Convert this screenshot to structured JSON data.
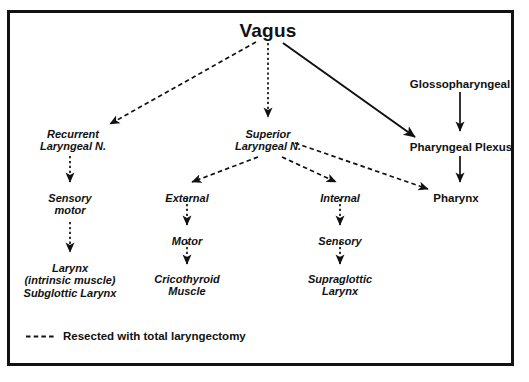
{
  "figure": {
    "title": "Vagus",
    "background_color": "#ffffff",
    "ink_color": "#111111",
    "frame_color": "#121212"
  },
  "nodes": {
    "vagus": {
      "lines": [
        "Vagus"
      ],
      "x": 268,
      "y": 20,
      "style": "title"
    },
    "glossopharyngeal": {
      "lines": [
        "Glossopharyngeal"
      ],
      "x": 460,
      "y": 78,
      "style": "plain"
    },
    "recurrent": {
      "lines": [
        "Recurrent",
        "Laryngeal N."
      ],
      "x": 73,
      "y": 128,
      "style": "branch"
    },
    "superior": {
      "lines": [
        "Superior",
        "Laryngeal N."
      ],
      "x": 268,
      "y": 128,
      "style": "branch"
    },
    "pharyngeal_plexus": {
      "lines": [
        "Pharyngeal Plexus"
      ],
      "x": 461,
      "y": 141,
      "style": "plain"
    },
    "sensory_motor": {
      "lines": [
        "Sensory",
        "motor"
      ],
      "x": 70,
      "y": 192,
      "style": "branch"
    },
    "external": {
      "lines": [
        "External"
      ],
      "x": 187,
      "y": 192,
      "style": "branch"
    },
    "internal": {
      "lines": [
        "Internal"
      ],
      "x": 340,
      "y": 192,
      "style": "branch"
    },
    "pharynx": {
      "lines": [
        "Pharynx"
      ],
      "x": 456,
      "y": 192,
      "style": "plain"
    },
    "motor": {
      "lines": [
        "Motor"
      ],
      "x": 187,
      "y": 235,
      "style": "branch"
    },
    "sensory": {
      "lines": [
        "Sensory"
      ],
      "x": 340,
      "y": 235,
      "style": "branch"
    },
    "larynx_group": {
      "lines": [
        "Larynx",
        "(intrinsic muscle)",
        "Subglottic Larynx"
      ],
      "x": 70,
      "y": 262,
      "style": "branch"
    },
    "cricothyroid": {
      "lines": [
        "Cricothyroid",
        "Muscle"
      ],
      "x": 187,
      "y": 273,
      "style": "branch"
    },
    "supraglottic": {
      "lines": [
        "Supraglottic",
        "Larynx"
      ],
      "x": 340,
      "y": 273,
      "style": "branch"
    }
  },
  "edges": [
    {
      "name": "vagus-to-recurrent",
      "from": "vagus",
      "to": "recurrent",
      "line": "dashed"
    },
    {
      "name": "vagus-to-superior",
      "from": "vagus",
      "to": "superior",
      "line": "dashed"
    },
    {
      "name": "vagus-to-pharyngeal-plexus",
      "from": "vagus",
      "to": "pharyngeal_plexus",
      "line": "solid"
    },
    {
      "name": "glossopharyngeal-to-plexus",
      "from": "glossopharyngeal",
      "to": "pharyngeal_plexus",
      "line": "solid"
    },
    {
      "name": "plexus-to-pharynx",
      "from": "pharyngeal_plexus",
      "to": "pharynx",
      "line": "solid"
    },
    {
      "name": "recurrent-to-sensory-motor",
      "from": "recurrent",
      "to": "sensory_motor",
      "line": "dashed"
    },
    {
      "name": "sensory-motor-to-larynx",
      "from": "sensory_motor",
      "to": "larynx_group",
      "line": "dashed"
    },
    {
      "name": "superior-to-external",
      "from": "superior",
      "to": "external",
      "line": "dashed"
    },
    {
      "name": "superior-to-internal",
      "from": "superior",
      "to": "internal",
      "line": "dashed"
    },
    {
      "name": "superior-to-pharynx",
      "from": "superior",
      "to": "pharynx",
      "line": "dashed"
    },
    {
      "name": "external-to-motor",
      "from": "external",
      "to": "motor",
      "line": "dashed"
    },
    {
      "name": "motor-to-cricothyroid",
      "from": "motor",
      "to": "cricothyroid",
      "line": "dashed"
    },
    {
      "name": "internal-to-sensory",
      "from": "internal",
      "to": "sensory",
      "line": "dashed"
    },
    {
      "name": "sensory-to-supraglottic",
      "from": "sensory",
      "to": "supraglottic",
      "line": "dashed"
    }
  ],
  "legend": {
    "line_style": "dashed",
    "label": "Resected with total laryngectomy"
  },
  "caption": ""
}
